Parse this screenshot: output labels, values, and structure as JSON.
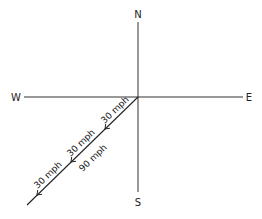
{
  "diagram": {
    "compass": {
      "north": "N",
      "south": "S",
      "east": "E",
      "west": "W"
    },
    "vectors": [
      {
        "label": "30 mph",
        "segment": 1
      },
      {
        "label": "30 mph",
        "segment": 2
      },
      {
        "label": "30 mph",
        "segment": 3
      }
    ],
    "resultant": {
      "label": "90 mph"
    },
    "colors": {
      "line": "#222222",
      "background": "#ffffff"
    }
  }
}
